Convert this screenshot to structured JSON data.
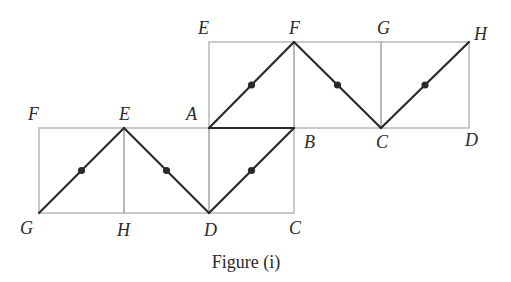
{
  "figure": {
    "caption": "Figure (i)",
    "colors": {
      "grid": "#b3b3b3",
      "path": "#2a2a2a",
      "text": "#2a2a2a"
    },
    "grid_x": [
      39,
      124,
      209,
      294,
      381,
      469
    ],
    "grid_y": [
      42,
      128,
      213
    ],
    "labels": [
      {
        "text": "E",
        "x": 198,
        "y": 34
      },
      {
        "text": "F",
        "x": 289,
        "y": 34
      },
      {
        "text": "G",
        "x": 377,
        "y": 34
      },
      {
        "text": "H",
        "x": 474,
        "y": 40
      },
      {
        "text": "F",
        "x": 28,
        "y": 120
      },
      {
        "text": "E",
        "x": 119,
        "y": 120
      },
      {
        "text": "A",
        "x": 186,
        "y": 120
      },
      {
        "text": "B",
        "x": 304,
        "y": 148
      },
      {
        "text": "C",
        "x": 376,
        "y": 148
      },
      {
        "text": "D",
        "x": 465,
        "y": 146
      },
      {
        "text": "G",
        "x": 20,
        "y": 234
      },
      {
        "text": "H",
        "x": 117,
        "y": 236
      },
      {
        "text": "D",
        "x": 204,
        "y": 236
      },
      {
        "text": "C",
        "x": 289,
        "y": 234
      }
    ],
    "rectangles": [
      {
        "name": "square-AEFB",
        "x1": 209,
        "y1": 42,
        "x2": 294,
        "y2": 128
      },
      {
        "name": "square-BFGC",
        "x1": 294,
        "y1": 42,
        "x2": 381,
        "y2": 128
      },
      {
        "name": "square-CGHD",
        "x1": 381,
        "y1": 42,
        "x2": 469,
        "y2": 128
      },
      {
        "name": "square-GFEH",
        "x1": 39,
        "y1": 128,
        "x2": 124,
        "y2": 213
      },
      {
        "name": "square-HEAD",
        "x1": 124,
        "y1": 128,
        "x2": 209,
        "y2": 213
      },
      {
        "name": "square-DABC",
        "x1": 209,
        "y1": 128,
        "x2": 294,
        "y2": 213
      }
    ],
    "path_segments": [
      {
        "from": "G",
        "to": "E",
        "x1": 39,
        "y1": 213,
        "x2": 124,
        "y2": 128,
        "dot": true
      },
      {
        "from": "E",
        "to": "D",
        "x1": 124,
        "y1": 128,
        "x2": 209,
        "y2": 213,
        "dot": true
      },
      {
        "from": "D",
        "to": "B",
        "x1": 209,
        "y1": 213,
        "x2": 294,
        "y2": 128,
        "dot": true
      },
      {
        "from": "B",
        "to": "A",
        "x1": 294,
        "y1": 128,
        "x2": 209,
        "y2": 128,
        "dot": false
      },
      {
        "from": "A",
        "to": "F",
        "x1": 209,
        "y1": 128,
        "x2": 294,
        "y2": 42,
        "dot": true
      },
      {
        "from": "F",
        "to": "C",
        "x1": 294,
        "y1": 42,
        "x2": 381,
        "y2": 128,
        "dot": true
      },
      {
        "from": "C",
        "to": "H",
        "x1": 381,
        "y1": 128,
        "x2": 469,
        "y2": 42,
        "dot": true
      }
    ]
  }
}
